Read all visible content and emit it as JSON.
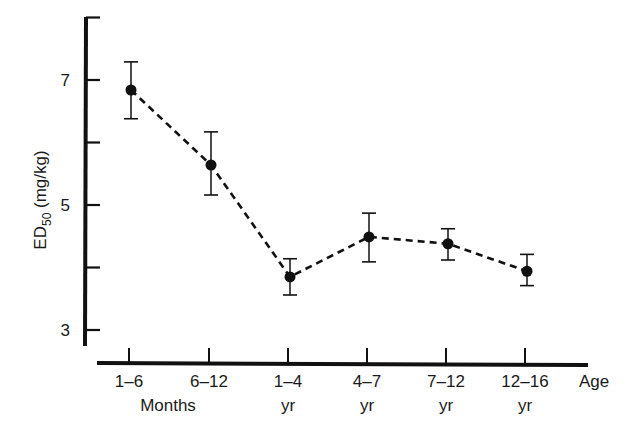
{
  "chart_data": {
    "type": "line",
    "title": "",
    "xlabel": "Age",
    "ylabel": "ED50 (mg/kg)",
    "ylabel_main": "ED",
    "ylabel_sub": "50",
    "ylabel_unit": " (mg/kg)",
    "ylim": [
      2.8,
      8
    ],
    "y_ticks": [
      3,
      4,
      5,
      6,
      7,
      8
    ],
    "y_tick_labels": [
      "3",
      "",
      "5",
      "",
      "7",
      ""
    ],
    "categories": [
      "1–6 Months",
      "6–12 Months",
      "1–4 yr",
      "4–7 yr",
      "7–12 yr",
      "12–16 yr"
    ],
    "x_tick_labels_line1": [
      "1–6",
      "6–12",
      "1–4",
      "4–7",
      "7–12",
      "12–16"
    ],
    "x_tick_labels_line2": [
      "Months",
      "",
      "yr",
      "yr",
      "yr",
      "yr"
    ],
    "x_group_label_months": "Months",
    "series": [
      {
        "name": "ED50",
        "style": "dashed line with filled circle markers",
        "values": [
          6.84,
          5.64,
          3.85,
          4.49,
          4.38,
          3.94
        ],
        "error_upper": [
          7.29,
          6.17,
          4.14,
          4.87,
          4.62,
          4.21
        ],
        "error_lower": [
          6.38,
          5.16,
          3.56,
          4.09,
          4.12,
          3.71
        ]
      }
    ],
    "grid": false,
    "legend": null
  },
  "colors": {
    "ink": "#111111",
    "background": "#ffffff"
  }
}
